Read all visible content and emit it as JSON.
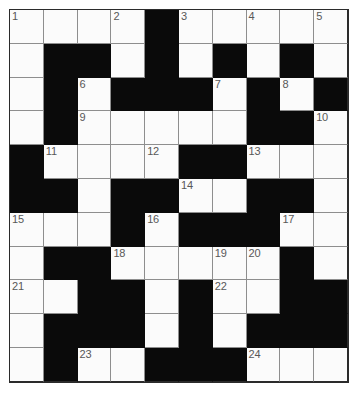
{
  "puzzle": {
    "type": "crossword-grid",
    "columns": 10,
    "rows": 11,
    "cell_size_px": 33.8,
    "colors": {
      "white_cell": "#fbfbfb",
      "black_cell": "#0a0a0a",
      "grid_line": "#8e8e8e",
      "border": "#2b2b2b",
      "number_text": "#585858",
      "page_background": "#ffffff"
    },
    "legend": {
      "W": "white (fillable) square",
      "B": "black (blocked) square"
    },
    "grid": [
      [
        "W",
        "W",
        "W",
        "W",
        "B",
        "W",
        "W",
        "W",
        "W",
        "W"
      ],
      [
        "W",
        "B",
        "B",
        "W",
        "B",
        "W",
        "B",
        "W",
        "B",
        "W"
      ],
      [
        "W",
        "B",
        "W",
        "B",
        "B",
        "B",
        "W",
        "B",
        "W",
        "B"
      ],
      [
        "W",
        "B",
        "W",
        "W",
        "W",
        "W",
        "W",
        "B",
        "B",
        "W"
      ],
      [
        "B",
        "W",
        "W",
        "W",
        "W",
        "B",
        "B",
        "W",
        "W",
        "W"
      ],
      [
        "B",
        "B",
        "W",
        "B",
        "B",
        "W",
        "W",
        "B",
        "B",
        "W"
      ],
      [
        "W",
        "W",
        "W",
        "B",
        "W",
        "B",
        "B",
        "B",
        "W",
        "W"
      ],
      [
        "W",
        "B",
        "B",
        "W",
        "W",
        "W",
        "W",
        "W",
        "B",
        "W"
      ],
      [
        "W",
        "W",
        "B",
        "B",
        "W",
        "B",
        "W",
        "W",
        "B",
        "B"
      ],
      [
        "W",
        "B",
        "B",
        "B",
        "W",
        "B",
        "W",
        "B",
        "B",
        "B"
      ],
      [
        "W",
        "B",
        "W",
        "W",
        "B",
        "B",
        "B",
        "W",
        "W",
        "W"
      ]
    ],
    "numbers": [
      {
        "row": 0,
        "col": 0,
        "label": "1"
      },
      {
        "row": 0,
        "col": 3,
        "label": "2"
      },
      {
        "row": 0,
        "col": 5,
        "label": "3"
      },
      {
        "row": 0,
        "col": 7,
        "label": "4"
      },
      {
        "row": 0,
        "col": 9,
        "label": "5"
      },
      {
        "row": 2,
        "col": 2,
        "label": "6"
      },
      {
        "row": 2,
        "col": 6,
        "label": "7"
      },
      {
        "row": 2,
        "col": 8,
        "label": "8"
      },
      {
        "row": 3,
        "col": 2,
        "label": "9"
      },
      {
        "row": 3,
        "col": 9,
        "label": "10"
      },
      {
        "row": 4,
        "col": 1,
        "label": "11"
      },
      {
        "row": 4,
        "col": 4,
        "label": "12"
      },
      {
        "row": 4,
        "col": 7,
        "label": "13"
      },
      {
        "row": 5,
        "col": 5,
        "label": "14"
      },
      {
        "row": 6,
        "col": 0,
        "label": "15"
      },
      {
        "row": 6,
        "col": 4,
        "label": "16"
      },
      {
        "row": 6,
        "col": 8,
        "label": "17"
      },
      {
        "row": 7,
        "col": 3,
        "label": "18"
      },
      {
        "row": 7,
        "col": 6,
        "label": "19"
      },
      {
        "row": 7,
        "col": 7,
        "label": "20"
      },
      {
        "row": 8,
        "col": 0,
        "label": "21"
      },
      {
        "row": 8,
        "col": 6,
        "label": "22"
      },
      {
        "row": 10,
        "col": 2,
        "label": "23"
      },
      {
        "row": 10,
        "col": 7,
        "label": "24"
      }
    ]
  }
}
